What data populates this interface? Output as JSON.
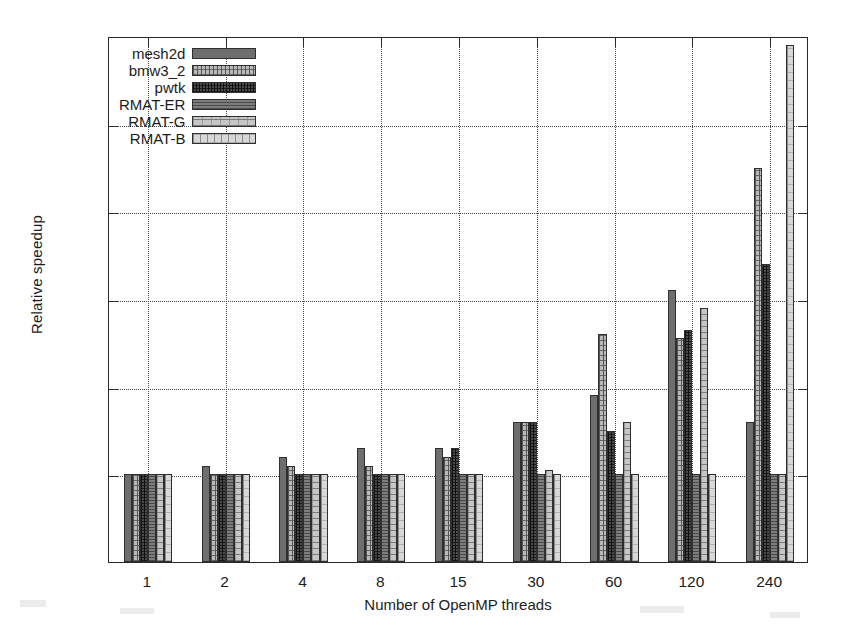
{
  "chart_data": {
    "type": "bar",
    "title": "",
    "xlabel": "Number of OpenMP threads",
    "ylabel": "Relative speedup",
    "categories": [
      "1",
      "2",
      "4",
      "8",
      "15",
      "30",
      "60",
      "120",
      "240"
    ],
    "ylim": [
      0.9,
      1.5
    ],
    "yticks": [
      "0.9",
      "1",
      "1.1",
      "1.2",
      "1.3",
      "1.4",
      "1.5"
    ],
    "ytick_values": [
      0.9,
      1.0,
      1.1,
      1.2,
      1.3,
      1.4,
      1.5
    ],
    "grid": "horizontal and vertical dotted gridlines",
    "legend_position": "top-left inside plot",
    "baseline": 0.9,
    "series": [
      {
        "name": "mesh2d",
        "pattern": "solid-dark-grey",
        "color": "#6e6e6e",
        "values": [
          1.0,
          1.01,
          1.02,
          1.03,
          1.03,
          1.06,
          1.09,
          1.21,
          1.06
        ]
      },
      {
        "name": "bmw3_2",
        "pattern": "light-grey-crosshatch",
        "color": "#b9b9b9",
        "values": [
          1.0,
          1.0,
          1.01,
          1.01,
          1.02,
          1.06,
          1.16,
          1.155,
          1.35
        ]
      },
      {
        "name": "pwtk",
        "pattern": "dark-dotted",
        "color": "#4a4a4a",
        "values": [
          1.0,
          1.0,
          1.0,
          1.0,
          1.03,
          1.06,
          1.05,
          1.165,
          1.24
        ]
      },
      {
        "name": "RMAT-ER",
        "pattern": "medium-grey-lines",
        "color": "#7d7d7d",
        "values": [
          1.0,
          1.0,
          1.0,
          1.0,
          1.0,
          1.0,
          1.0,
          1.0,
          1.0
        ]
      },
      {
        "name": "RMAT-G",
        "pattern": "light-grey-dashes",
        "color": "#c6c6c6",
        "values": [
          1.0,
          1.0,
          1.0,
          1.0,
          1.0,
          1.005,
          1.06,
          1.19,
          1.0
        ]
      },
      {
        "name": "RMAT-B",
        "pattern": "very-light-grey-dashed",
        "color": "#d8d8d8",
        "values": [
          1.0,
          1.0,
          1.0,
          1.0,
          1.0,
          1.0,
          1.0,
          1.0,
          1.49
        ]
      }
    ]
  },
  "legend": {
    "items": [
      {
        "label": "mesh2d"
      },
      {
        "label": "bmw3_2"
      },
      {
        "label": "pwtk"
      },
      {
        "label": "RMAT-ER"
      },
      {
        "label": "RMAT-G"
      },
      {
        "label": "RMAT-B"
      }
    ]
  },
  "axes": {
    "y_title": "Relative speedup",
    "x_title": "Number of OpenMP threads"
  }
}
